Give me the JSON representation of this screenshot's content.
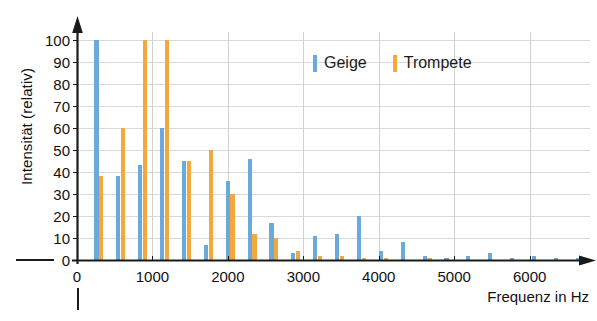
{
  "chart_data": {
    "type": "bar",
    "title": "",
    "subtitle": "",
    "xlabel": "Frequenz in Hz",
    "ylabel": "Intensität (relativ)",
    "xlim": [
      0,
      6800
    ],
    "ylim": [
      0,
      105
    ],
    "grid": true,
    "legend_position": "top-center",
    "x_ticks": [
      0,
      1000,
      2000,
      3000,
      4000,
      5000,
      6000
    ],
    "x_tick_labels": [
      "0",
      "1000",
      "2000",
      "3000",
      "4000",
      "5000",
      "6000"
    ],
    "y_ticks": [
      0,
      10,
      20,
      30,
      40,
      50,
      60,
      70,
      80,
      90,
      100
    ],
    "y_tick_labels": [
      "0",
      "10",
      "20",
      "30",
      "40",
      "50",
      "60",
      "70",
      "80",
      "90",
      "100"
    ],
    "x": [
      290,
      580,
      870,
      1160,
      1450,
      1740,
      2030,
      2320,
      2610,
      2900,
      3190,
      3480,
      3770,
      4060,
      4350,
      4640,
      4930,
      5220,
      5510,
      5800,
      6090,
      6380,
      6670
    ],
    "series": [
      {
        "name": "Geige",
        "color": "#6aa9d8",
        "values": [
          100,
          38,
          43,
          60,
          45,
          7,
          36,
          46,
          17,
          3,
          11,
          12,
          20,
          4,
          8,
          2,
          1,
          2,
          3,
          1,
          2,
          1,
          1
        ]
      },
      {
        "name": "Trompete",
        "color": "#f2a83c",
        "values": [
          38,
          60,
          100,
          100,
          45,
          50,
          30,
          12,
          10,
          4,
          2,
          2,
          1,
          1,
          0,
          1,
          0,
          0,
          0,
          0,
          0,
          0,
          0
        ]
      }
    ]
  },
  "legend": {
    "items": [
      {
        "label": "Geige",
        "color": "#6aa9d8"
      },
      {
        "label": "Trompete",
        "color": "#f2a83c"
      }
    ]
  },
  "axes": {
    "x_axis_title": "Frequenz in Hz",
    "y_axis_title": "Intensität (relativ)"
  }
}
